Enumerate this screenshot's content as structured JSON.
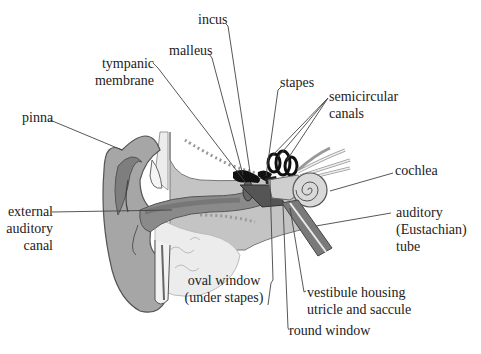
{
  "diagram": {
    "colors": {
      "background": "#ffffff",
      "text": "#222222",
      "leader_line": "#444444",
      "outer_ear": "#a9a9a9",
      "outer_ear_dark": "#7d7d7d",
      "skin_outline": "#555555",
      "bone_texture": "#b5b5b5",
      "bone_light": "#e6e6e6",
      "ossicles": "#111111",
      "cochlea": "#dcdcdc",
      "nerve": "#eeeeee",
      "canal_dark": "#6a6a6a"
    },
    "labels": {
      "incus": "incus",
      "malleus": "malleus",
      "tympanic_membrane_line1": "tympanic",
      "tympanic_membrane_line2": "membrane",
      "stapes": "stapes",
      "semicircular_canals_line1": "semicircular",
      "semicircular_canals_line2": "canals",
      "pinna": "pinna",
      "cochlea": "cochlea",
      "external_auditory_canal_line1": "external",
      "external_auditory_canal_line2": "auditory",
      "external_auditory_canal_line3": "canal",
      "auditory_tube_line1": "auditory",
      "auditory_tube_line2": "(Eustachian)",
      "auditory_tube_line3": "tube",
      "oval_window_line1": "oval window",
      "oval_window_line2": "(under stapes)",
      "vestibule_line1": "vestibule housing",
      "vestibule_line2": "utricle and saccule",
      "round_window": "round window"
    }
  }
}
